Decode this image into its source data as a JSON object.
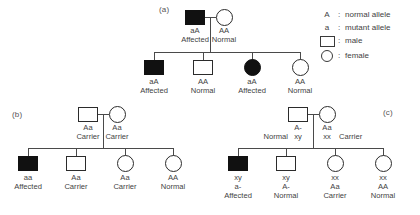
{
  "figure": {
    "background": "#ffffff",
    "line_color": "#4a4a4a",
    "symbol_stroke": "#2b2b2b",
    "affected_fill": "#111111"
  },
  "legend": {
    "separator": ":",
    "rows": [
      {
        "key": "A",
        "icon": "",
        "text": "normal allele"
      },
      {
        "key": "a",
        "icon": "",
        "text": "mutant allele"
      },
      {
        "key": "",
        "icon": "square-icon",
        "text": "male"
      },
      {
        "key": "",
        "icon": "circle-icon",
        "text": "female"
      }
    ]
  },
  "panels": [
    {
      "id": "a",
      "label": "(a)",
      "inheritance": "autosomal dominant",
      "parents": [
        {
          "sex": "male",
          "status": "affected",
          "genotype": "aA",
          "phenotype": "Affected"
        },
        {
          "sex": "female",
          "status": "normal",
          "genotype": "AA",
          "phenotype": "Normal"
        }
      ],
      "children": [
        {
          "sex": "male",
          "status": "affected",
          "genotype": "aA",
          "phenotype": "Affected"
        },
        {
          "sex": "male",
          "status": "normal",
          "genotype": "AA",
          "phenotype": "Normal"
        },
        {
          "sex": "female",
          "status": "affected",
          "genotype": "aA",
          "phenotype": "Affected"
        },
        {
          "sex": "female",
          "status": "normal",
          "genotype": "AA",
          "phenotype": "Normal"
        }
      ]
    },
    {
      "id": "b",
      "label": "(b)",
      "inheritance": "autosomal recessive",
      "parents": [
        {
          "sex": "male",
          "status": "carrier",
          "genotype": "Aa",
          "phenotype": "Carrier"
        },
        {
          "sex": "female",
          "status": "carrier",
          "genotype": "Aa",
          "phenotype": "Carrier"
        }
      ],
      "children": [
        {
          "sex": "male",
          "status": "affected",
          "genotype": "aa",
          "phenotype": "Affected"
        },
        {
          "sex": "male",
          "status": "carrier",
          "genotype": "Aa",
          "phenotype": "Carrier"
        },
        {
          "sex": "female",
          "status": "carrier",
          "genotype": "Aa",
          "phenotype": "Carrier"
        },
        {
          "sex": "female",
          "status": "normal",
          "genotype": "AA",
          "phenotype": "Normal"
        }
      ]
    },
    {
      "id": "c",
      "label": "(c)",
      "inheritance": "X-linked recessive",
      "parents": [
        {
          "sex": "male",
          "status": "normal",
          "genotype": "A-",
          "sex_chromosomes": "xy",
          "phenotype": "Normal"
        },
        {
          "sex": "female",
          "status": "carrier",
          "genotype": "Aa",
          "sex_chromosomes": "xx",
          "phenotype": "Carrier"
        }
      ],
      "children": [
        {
          "sex": "male",
          "status": "affected",
          "sex_chromosomes": "xy",
          "genotype": "a-",
          "phenotype": "Affected"
        },
        {
          "sex": "male",
          "status": "normal",
          "sex_chromosomes": "xy",
          "genotype": "A-",
          "phenotype": "Normal"
        },
        {
          "sex": "female",
          "status": "carrier",
          "sex_chromosomes": "xx",
          "genotype": "Aa",
          "phenotype": "Carrier"
        },
        {
          "sex": "female",
          "status": "normal",
          "sex_chromosomes": "xx",
          "genotype": "AA",
          "phenotype": "Normal"
        }
      ]
    }
  ]
}
